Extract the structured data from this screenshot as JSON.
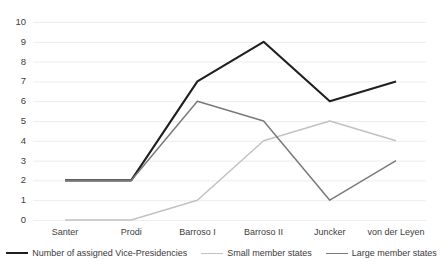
{
  "chart_data": {
    "type": "line",
    "title": "",
    "subtitle": "",
    "xlabel": "",
    "ylabel": "",
    "categories": [
      "Santer",
      "Prodi",
      "Barroso I",
      "Barroso II",
      "Juncker",
      "von der Leyen"
    ],
    "series": [
      {
        "name": "Number of assigned Vice-Presidencies",
        "values": [
          2,
          2,
          7,
          9,
          6,
          7
        ],
        "color": "#1f1f1f",
        "width": 2.1
      },
      {
        "name": "Small member states",
        "values": [
          0,
          0,
          1,
          4,
          5,
          4
        ],
        "color": "#c2c2c2",
        "width": 1.5
      },
      {
        "name": "Large member states",
        "values": [
          2,
          2,
          6,
          5,
          1,
          3
        ],
        "color": "#7a7a7a",
        "width": 1.5
      }
    ],
    "ylim": [
      0,
      10
    ],
    "ytick_values": [
      0,
      1,
      2,
      3,
      4,
      5,
      6,
      7,
      8,
      9,
      10
    ],
    "ytick_labels": [
      "0",
      "1",
      "2",
      "3",
      "4",
      "5",
      "6",
      "7",
      "8",
      "9",
      "10"
    ],
    "grid": true,
    "grid_axis": "y",
    "grid_color": "#ededed",
    "legend_position": "bottom",
    "legend_orientation": "horizontal",
    "background": "#ffffff"
  }
}
